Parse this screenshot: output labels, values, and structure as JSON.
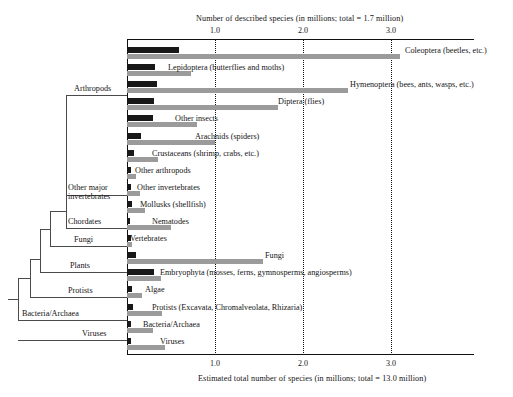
{
  "figure": {
    "top_axis_title": "Number of described species (in millions; total = 1.7 million)",
    "bottom_axis_title": "Estimated total number of species (in millions; total = 13.0 million)",
    "ticks": [
      "1.0",
      "2.0",
      "3.0"
    ]
  },
  "tree": {
    "labels": [
      {
        "text": "Arthropods"
      },
      {
        "text": "Other major"
      },
      {
        "text": "invertebrates"
      },
      {
        "text": "Chordates"
      },
      {
        "text": "Fungi"
      },
      {
        "text": "Plants"
      },
      {
        "text": "Protists"
      },
      {
        "text": "Bacteria/Archaea"
      },
      {
        "text": "Viruses"
      }
    ]
  },
  "chart_data": {
    "type": "bar",
    "orientation": "horizontal",
    "title": "",
    "xlabel_top": "Number of described species (in millions; total = 1.7 million)",
    "xlabel_bottom": "Estimated total number of species (in millions; total = 13.0 million)",
    "xlim": [
      0,
      3.95
    ],
    "xticks": [
      1.0,
      2.0,
      3.0
    ],
    "grid": "dotted vertical at xticks",
    "legend": "none (dark = described species, light gray = estimated total)",
    "series": [
      {
        "name": "Described species (millions)",
        "color": "#181818"
      },
      {
        "name": "Estimated total species (millions)",
        "color": "#9b9b9b"
      }
    ],
    "categories": [
      "Coleoptera (beetles, etc.)",
      "Lepidoptera (butterflies and moths)",
      "Hymenoptera (bees, ants, wasps, etc.)",
      "Diptera (flies)",
      "Other insects",
      "Arachnids (spiders)",
      "Crustaceans (shrimp, crabs, etc.)",
      "Other arthropods",
      "Other invertebrates",
      "Mollusks (shellfish)",
      "Nematodes",
      "Vertebrates",
      "Fungi",
      "Embryophyta (mosses, ferns, gymnosperms, angiosperms)",
      "Algae",
      "Protists (Excavata, Chromalveolata, Rhizaria)",
      "Bacteria/Archaea",
      "Viruses"
    ],
    "described": [
      0.59,
      0.32,
      0.34,
      0.31,
      0.3,
      0.16,
      0.08,
      0.04,
      0.04,
      0.06,
      0.03,
      0.05,
      0.1,
      0.31,
      0.06,
      0.07,
      0.04,
      0.04
    ],
    "estimated": [
      3.1,
      0.73,
      2.51,
      1.72,
      0.8,
      1.0,
      0.35,
      0.1,
      0.15,
      0.2,
      0.5,
      0.06,
      1.55,
      0.39,
      0.17,
      0.4,
      0.3,
      0.43
    ]
  },
  "rows": [
    {
      "label": "Coleoptera (beetles, etc.)",
      "described": 0.59,
      "estimated": 3.1,
      "label_x": 405
    },
    {
      "label": "Lepidoptera (butterflies and moths)",
      "described": 0.32,
      "estimated": 0.73,
      "label_x": 168
    },
    {
      "label": "Hymenoptera (bees, ants, wasps, etc.)",
      "described": 0.34,
      "estimated": 2.51,
      "label_x": 350
    },
    {
      "label": "Diptera (flies)",
      "described": 0.31,
      "estimated": 1.72,
      "label_x": 278
    },
    {
      "label": "Other insects",
      "described": 0.3,
      "estimated": 0.8,
      "label_x": 175
    },
    {
      "label": "Arachnids (spiders)",
      "described": 0.16,
      "estimated": 1.0,
      "label_x": 195
    },
    {
      "label": "Crustaceans (shrimp, crabs, etc.)",
      "described": 0.08,
      "estimated": 0.35,
      "label_x": 152
    },
    {
      "label": "Other arthropods",
      "described": 0.04,
      "estimated": 0.1,
      "label_x": 135
    },
    {
      "label": "Other invertebrates",
      "described": 0.04,
      "estimated": 0.15,
      "label_x": 137
    },
    {
      "label": "Mollusks (shellfish)",
      "described": 0.06,
      "estimated": 0.2,
      "label_x": 140
    },
    {
      "label": "Nematodes",
      "described": 0.03,
      "estimated": 0.5,
      "label_x": 152
    },
    {
      "label": "Vertebrates",
      "described": 0.05,
      "estimated": 0.06,
      "label_x": 130
    },
    {
      "label": "Fungi",
      "described": 0.1,
      "estimated": 1.55,
      "label_x": 265
    },
    {
      "label": "Embryophyta (mosses, ferns, gymnosperms, angiosperms)",
      "described": 0.31,
      "estimated": 0.39,
      "label_x": 160
    },
    {
      "label": "Algae",
      "described": 0.06,
      "estimated": 0.17,
      "label_x": 145
    },
    {
      "label": "Protists (Excavata, Chromalveolata, Rhizaria)",
      "described": 0.07,
      "estimated": 0.4,
      "label_x": 152
    },
    {
      "label": "Bacteria/Archaea",
      "described": 0.04,
      "estimated": 0.3,
      "label_x": 143
    },
    {
      "label": "Viruses",
      "described": 0.04,
      "estimated": 0.43,
      "label_x": 160
    }
  ]
}
